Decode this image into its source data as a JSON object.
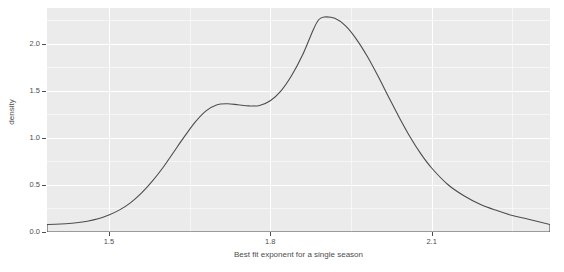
{
  "chart_data": {
    "type": "area",
    "title": "",
    "subtitle": "",
    "xlabel": "Best fit exponent for a single season",
    "ylabel": "density",
    "xlim": [
      1.385,
      2.32
    ],
    "ylim": [
      0.0,
      2.38
    ],
    "grid": true,
    "legend": null,
    "style": {
      "panel_background": "#ebebeb",
      "grid_color": "#ffffff",
      "curve_color": "#4d4d4d",
      "text_color": "#4d4d4d",
      "plot_background": "#ffffff"
    },
    "x_ticks": [
      {
        "value": 1.5,
        "label": "1.5"
      },
      {
        "value": 1.8,
        "label": "1.8"
      },
      {
        "value": 2.1,
        "label": "2.1"
      }
    ],
    "x_minor_ticks": [
      1.65,
      1.95,
      2.25
    ],
    "y_ticks": [
      {
        "value": 0.0,
        "label": "0.0"
      },
      {
        "value": 0.5,
        "label": "0.5"
      },
      {
        "value": 1.0,
        "label": "1.0"
      },
      {
        "value": 1.5,
        "label": "1.5"
      },
      {
        "value": 2.0,
        "label": "2.0"
      }
    ],
    "y_minor_ticks": [
      0.25,
      0.75,
      1.25,
      1.75,
      2.25
    ],
    "series": [
      {
        "name": "density",
        "closed": true,
        "x": [
          1.385,
          1.4,
          1.42,
          1.44,
          1.46,
          1.48,
          1.5,
          1.52,
          1.54,
          1.56,
          1.58,
          1.6,
          1.62,
          1.64,
          1.66,
          1.68,
          1.7,
          1.72,
          1.74,
          1.76,
          1.78,
          1.8,
          1.82,
          1.84,
          1.86,
          1.88,
          1.89,
          1.9,
          1.92,
          1.94,
          1.96,
          1.98,
          2.0,
          2.02,
          2.04,
          2.06,
          2.08,
          2.1,
          2.13,
          2.16,
          2.19,
          2.22,
          2.25,
          2.28,
          2.32
        ],
        "y": [
          0.08,
          0.082,
          0.088,
          0.098,
          0.115,
          0.14,
          0.18,
          0.235,
          0.31,
          0.41,
          0.535,
          0.68,
          0.845,
          1.01,
          1.165,
          1.285,
          1.35,
          1.362,
          1.352,
          1.34,
          1.345,
          1.395,
          1.5,
          1.665,
          1.88,
          2.15,
          2.255,
          2.285,
          2.27,
          2.19,
          2.05,
          1.87,
          1.66,
          1.435,
          1.215,
          1.01,
          0.83,
          0.68,
          0.505,
          0.385,
          0.295,
          0.23,
          0.175,
          0.135,
          0.08
        ]
      }
    ]
  }
}
